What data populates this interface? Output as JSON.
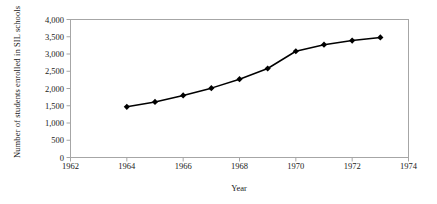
{
  "chart_data": {
    "type": "line",
    "title": "",
    "xlabel": "Year",
    "ylabel": "Number of students enrolled in SIL schools",
    "x": [
      1964,
      1965,
      1966,
      1967,
      1968,
      1969,
      1970,
      1971,
      1972,
      1973
    ],
    "values": [
      1470,
      1610,
      1800,
      2010,
      2270,
      2580,
      3080,
      3270,
      3390,
      3480
    ],
    "series": [
      {
        "name": "Students enrolled in SIL schools",
        "values": [
          1470,
          1610,
          1800,
          2010,
          2270,
          2580,
          3080,
          3270,
          3390,
          3480
        ]
      }
    ],
    "xlim": [
      1962,
      1974
    ],
    "ylim": [
      0,
      4000
    ],
    "xticks": [
      1962,
      1964,
      1966,
      1968,
      1970,
      1972,
      1974
    ],
    "xtick_labels": [
      "1962",
      "1964",
      "1966",
      "1968",
      "1970",
      "1972",
      "1974"
    ],
    "yticks": [
      0,
      500,
      1000,
      1500,
      2000,
      2500,
      3000,
      3500,
      4000
    ],
    "ytick_labels": [
      "0",
      "500",
      "1,000",
      "1,500",
      "2,000",
      "2,500",
      "3,000",
      "3,500",
      "4,000"
    ],
    "grid": false,
    "legend": false,
    "marker": "diamond",
    "line_color": "#000000",
    "marker_color": "#000000",
    "frame_color": "#a6a6a6",
    "background": "#ffffff"
  }
}
